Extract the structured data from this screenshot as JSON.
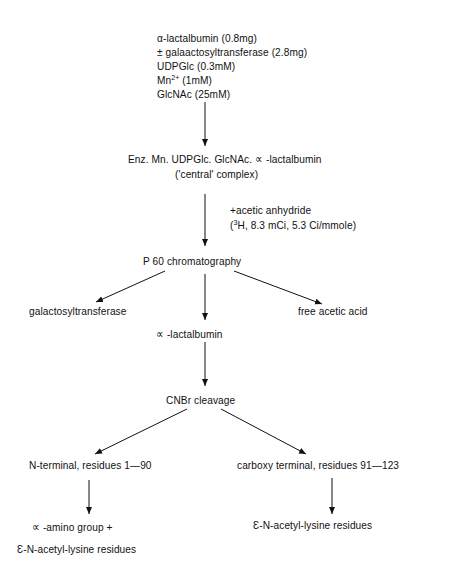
{
  "diagram": {
    "type": "flowchart",
    "nodes": {
      "reagents": {
        "line1": "α-lactalbumin  (0.8mg)",
        "line2": "± galaactosyltransferase  (2.8mg)",
        "line3": "UDPGlc  (0.3mM)",
        "line4_base": "Mn",
        "line4_sup": "2+",
        "line4_rest": " (1mM)",
        "line5": "GlcNAc  (25mM)"
      },
      "complex": {
        "line1": "Enz. Mn. UDPGlc. GlcNAc. ∝ -lactalbumin",
        "line2": "('central' complex)"
      },
      "reaction": {
        "line1": "+acetic anhydride",
        "line2_pre": "(",
        "line2_sup": "3",
        "line2_rest": "H, 8.3  mCi,  5.3 Ci/mmole)"
      },
      "chromatography": "P 60  chromatography",
      "galactosyltransferase": "galactosyltransferase",
      "free_acid": "free  acetic  acid",
      "lactalbumin": "∝ -lactalbumin",
      "cleavage": "CNBr  cleavage",
      "n_terminal": "N-terminal, residues  1—90",
      "c_terminal": "carboxy  terminal,  residues  91—123",
      "n_product": {
        "line1": "∝ -amino  group  +",
        "line2": "Ɛ-N-acetyl-lysine  residues"
      },
      "c_product": "Ɛ-N-acetyl-lysine  residues"
    }
  }
}
